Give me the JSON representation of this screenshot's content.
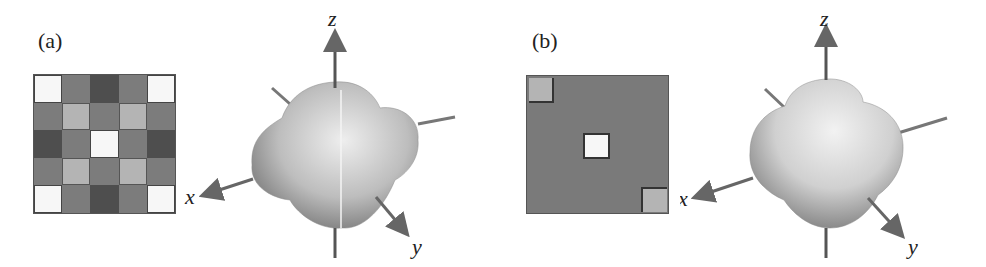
{
  "panels": [
    {
      "label": "(a)",
      "grid": {
        "rows": 5,
        "cols": 5,
        "cells": [
          [
            "white",
            "mid",
            "dark",
            "mid",
            "white"
          ],
          [
            "mid",
            "light",
            "mid",
            "light",
            "mid"
          ],
          [
            "dark",
            "mid",
            "white",
            "mid",
            "dark"
          ],
          [
            "mid",
            "light",
            "mid",
            "light",
            "mid"
          ],
          [
            "white",
            "mid",
            "dark",
            "mid",
            "white"
          ]
        ]
      },
      "axes": {
        "x": "x",
        "y": "y",
        "z": "z"
      },
      "surface": "four-lobed in-plane shape with z-axis seam"
    },
    {
      "label": "(b)",
      "grid": {
        "rows": 5,
        "cols": 5,
        "cells": [
          [
            "light",
            "mid",
            "mid",
            "mid",
            "mid"
          ],
          [
            "mid",
            "mid",
            "mid",
            "mid",
            "mid"
          ],
          [
            "mid",
            "mid",
            "white",
            "mid",
            "mid"
          ],
          [
            "mid",
            "mid",
            "mid",
            "mid",
            "mid"
          ],
          [
            "mid",
            "mid",
            "mid",
            "mid",
            "light"
          ]
        ]
      },
      "axes": {
        "x": "x",
        "y": "y",
        "z": "z"
      },
      "surface": "lobed shape with top lobe along z"
    }
  ],
  "colors": {
    "white": "#f7f7f7",
    "light": "#b4b4b4",
    "mid": "#7c7c7c",
    "dark": "#4e4e4e"
  }
}
